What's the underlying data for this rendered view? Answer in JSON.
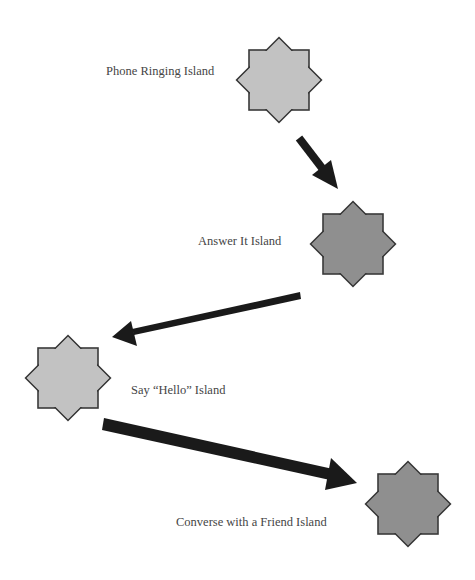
{
  "diagram": {
    "type": "flow",
    "colors": {
      "background": "#ffffff",
      "star_light": "#c2c2c2",
      "star_dark": "#8f8f8f",
      "star_stroke": "#3a3a3a",
      "arrow": "#1a1a1a",
      "label": "#454545"
    },
    "islands": [
      {
        "id": "phone-ringing",
        "label": "Phone Ringing Island",
        "shade": "light"
      },
      {
        "id": "answer-it",
        "label": "Answer It Island",
        "shade": "dark"
      },
      {
        "id": "say-hello",
        "label": "Say “Hello” Island",
        "shade": "light"
      },
      {
        "id": "converse",
        "label": "Converse with a Friend Island",
        "shade": "dark"
      }
    ],
    "arrows": [
      {
        "from": "phone-ringing",
        "to": "answer-it"
      },
      {
        "from": "answer-it",
        "to": "say-hello"
      },
      {
        "from": "say-hello",
        "to": "converse"
      }
    ]
  }
}
